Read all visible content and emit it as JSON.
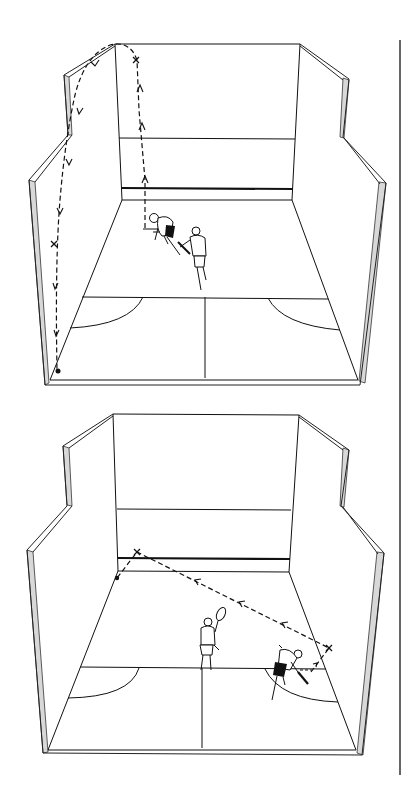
{
  "diagram": {
    "panels": [
      {
        "id": "top",
        "shot": "lob from front-left corner to back-left corner",
        "markers": [
          "x",
          "x",
          "dot"
        ],
        "players": 2
      },
      {
        "id": "bottom",
        "shot": "crosscourt shot from back-right to front-left",
        "markers": [
          "x",
          "x",
          "dot"
        ],
        "players": 2
      }
    ]
  },
  "colors": {
    "line": "#111111",
    "wall_edge": "#d8d8d8",
    "background": "#ffffff"
  }
}
